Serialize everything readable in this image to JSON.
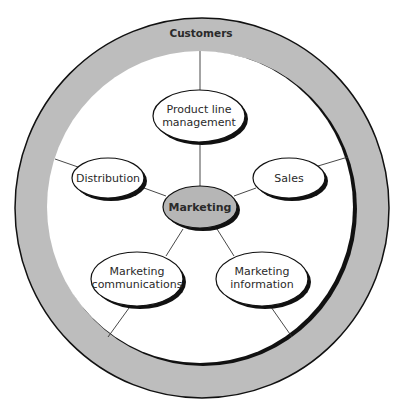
{
  "diagram": {
    "colors": {
      "ring_fill": "#bdbdbd",
      "center_fill": "#b6b6b6",
      "node_fill": "#ffffff",
      "stroke": "#111111",
      "line": "#333333"
    },
    "ring": {
      "label": "Customers"
    },
    "center": {
      "label": "Marketing"
    },
    "nodes": [
      {
        "id": "product-line-management",
        "lines": [
          "Product line",
          "management"
        ]
      },
      {
        "id": "distribution",
        "lines": [
          "Distribution"
        ]
      },
      {
        "id": "sales",
        "lines": [
          "Sales"
        ]
      },
      {
        "id": "marketing-communications",
        "lines": [
          "Marketing",
          "communications"
        ]
      },
      {
        "id": "marketing-information",
        "lines": [
          "Marketing",
          "information"
        ]
      }
    ],
    "edges": [
      {
        "from": "Marketing",
        "to": "Product line management"
      },
      {
        "from": "Marketing",
        "to": "Distribution"
      },
      {
        "from": "Marketing",
        "to": "Sales"
      },
      {
        "from": "Marketing",
        "to": "Marketing communications"
      },
      {
        "from": "Marketing",
        "to": "Marketing information"
      },
      {
        "from": "Product line management",
        "to": "Customers"
      },
      {
        "from": "Distribution",
        "to": "Customers"
      },
      {
        "from": "Sales",
        "to": "Customers"
      },
      {
        "from": "Marketing communications",
        "to": "Customers"
      },
      {
        "from": "Marketing information",
        "to": "Customers"
      }
    ]
  }
}
